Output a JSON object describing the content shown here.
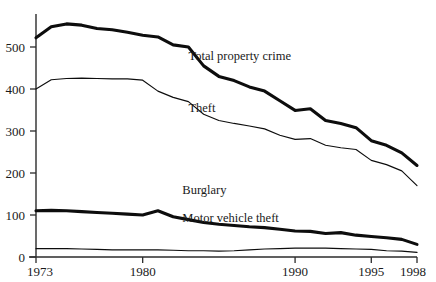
{
  "chart_data": {
    "type": "line",
    "title": "",
    "subtitle": "",
    "xlabel": "",
    "ylabel": "",
    "xlim": [
      1973,
      1998
    ],
    "ylim": [
      0,
      560
    ],
    "grid": false,
    "legend_position": "inline-annotations",
    "x": [
      1973,
      1974,
      1975,
      1976,
      1977,
      1978,
      1979,
      1980,
      1981,
      1982,
      1983,
      1984,
      1985,
      1986,
      1987,
      1988,
      1989,
      1990,
      1991,
      1992,
      1993,
      1994,
      1995,
      1996,
      1997,
      1998
    ],
    "x_tick_values": [
      1973,
      1980,
      1990,
      1995,
      1998
    ],
    "x_tick_labels": [
      "1973",
      "1980",
      "1990",
      "1995",
      "1998"
    ],
    "y_tick_values": [
      0,
      100,
      200,
      300,
      400,
      500
    ],
    "y_tick_labels": [
      "0",
      "100",
      "200",
      "300",
      "400",
      "500"
    ],
    "series": [
      {
        "name": "Total property crime",
        "label": "Total property crime",
        "line_weight": "thick",
        "color": "#0d0d0d",
        "label_x": 1983.0,
        "label_y": 470,
        "values": [
          522,
          548,
          555,
          552,
          544,
          541,
          535,
          528,
          524,
          505,
          500,
          455,
          430,
          420,
          405,
          395,
          372,
          349,
          353,
          325,
          318,
          308,
          277,
          266,
          248,
          218
        ]
      },
      {
        "name": "Theft",
        "label": "Theft",
        "line_weight": "thin",
        "color": "#0d0d0d",
        "label_x": 1983.0,
        "label_y": 345,
        "values": [
          400,
          422,
          425,
          426,
          425,
          424,
          424,
          421,
          395,
          380,
          370,
          340,
          325,
          318,
          312,
          305,
          290,
          280,
          282,
          266,
          260,
          256,
          230,
          220,
          205,
          170
        ]
      },
      {
        "name": "Burglary",
        "label": "Burglary",
        "line_weight": "thick",
        "color": "#0d0d0d",
        "label_x": 1982.6,
        "label_y": 150,
        "values": [
          110,
          111,
          110,
          108,
          106,
          104,
          102,
          100,
          110,
          96,
          89,
          82,
          78,
          75,
          72,
          70,
          66,
          62,
          61,
          56,
          58,
          52,
          49,
          46,
          42,
          30
        ]
      },
      {
        "name": "Motor vehicle theft",
        "label": "Motor vehicle theft",
        "line_weight": "thin",
        "color": "#0d0d0d",
        "label_x": 1982.6,
        "label_y": 83,
        "values": [
          20,
          20,
          20,
          19,
          18,
          17,
          17,
          17,
          17,
          16,
          15,
          15,
          14,
          15,
          17,
          19,
          20,
          21,
          21,
          21,
          20,
          19,
          18,
          15,
          14,
          11
        ]
      }
    ]
  },
  "axes": {
    "y_axis_name": "y-axis",
    "x_axis_name": "x-axis"
  }
}
